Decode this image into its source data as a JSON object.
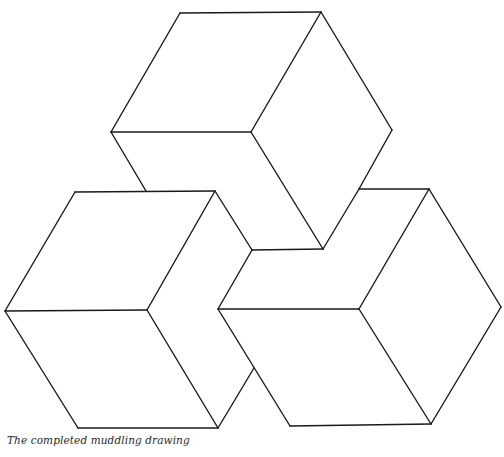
{
  "figure": {
    "caption": "The completed muddling drawing",
    "line_color": "#1a1a1a",
    "background": "#ffffff",
    "shapes": [
      {
        "name": "top-cube"
      },
      {
        "name": "left-cube"
      },
      {
        "name": "right-cube"
      }
    ]
  }
}
